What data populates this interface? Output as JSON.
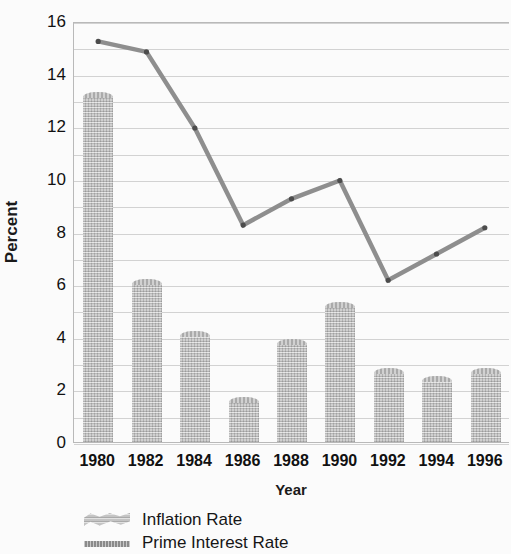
{
  "chart_data": {
    "type": "bar",
    "title": "",
    "xlabel": "Year",
    "ylabel": "Percent",
    "categories": [
      "1980",
      "1982",
      "1984",
      "1986",
      "1988",
      "1990",
      "1992",
      "1994",
      "1996"
    ],
    "ylim": [
      0,
      16
    ],
    "ytick_step": 2,
    "yticks": [
      "0",
      "2",
      "4",
      "6",
      "8",
      "10",
      "12",
      "14",
      "16"
    ],
    "grid": true,
    "gridline_step": 1,
    "legend_position": "below-plot-left",
    "series": [
      {
        "name": "Inflation Rate",
        "type": "bar",
        "color": "#b5b5b5",
        "values": [
          13.2,
          6.1,
          4.1,
          1.6,
          3.8,
          5.2,
          2.7,
          2.4,
          2.7
        ]
      },
      {
        "name": "Prime Interest Rate",
        "type": "line",
        "color": "#8e8e8e",
        "values": [
          15.3,
          14.9,
          12.0,
          8.3,
          9.3,
          10.0,
          6.2,
          7.2,
          8.2
        ]
      }
    ]
  },
  "legend": {
    "items": [
      {
        "label": "Inflation Rate",
        "swatch": "textured-bar-swatch"
      },
      {
        "label": "Prime Interest Rate",
        "swatch": "line-swatch"
      }
    ]
  }
}
